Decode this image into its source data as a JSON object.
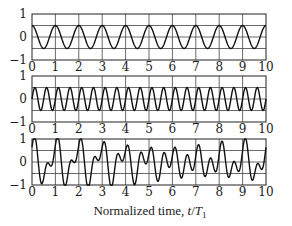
{
  "chart_data": [
    {
      "type": "line",
      "title": "",
      "xlabel": "",
      "ylabel": "",
      "xlim": [
        0,
        10
      ],
      "ylim": [
        -1,
        1
      ],
      "grid": true,
      "x_ticks": [
        "0",
        "1",
        "2",
        "3",
        "4",
        "5",
        "6",
        "7",
        "8",
        "9",
        "10"
      ],
      "y_ticks": [
        "1",
        "0",
        "−1"
      ],
      "y_gridlines": [
        -0.5,
        0,
        0.5
      ],
      "series": [
        {
          "name": "component 1",
          "function": "cos",
          "frequency": 1,
          "amplitude": 0.5,
          "phase": 0
        }
      ]
    },
    {
      "type": "line",
      "title": "",
      "xlabel": "",
      "ylabel": "",
      "xlim": [
        0,
        10
      ],
      "ylim": [
        -1,
        1
      ],
      "grid": true,
      "x_ticks": [
        "0",
        "1",
        "2",
        "3",
        "4",
        "5",
        "6",
        "7",
        "8",
        "9",
        "10"
      ],
      "y_ticks": [
        "1",
        "0",
        "−1"
      ],
      "y_gridlines": [
        -0.5,
        0,
        0.5
      ],
      "series": [
        {
          "name": "component 2",
          "function": "sin",
          "frequency": 2,
          "amplitude": 0.5,
          "phase": 0
        }
      ]
    },
    {
      "type": "line",
      "title": "",
      "xlabel": "Normalized time, t/T₁",
      "ylabel": "",
      "xlim": [
        0,
        10
      ],
      "ylim": [
        -1,
        1
      ],
      "grid": true,
      "x_ticks": [
        "0",
        "1",
        "2",
        "3",
        "4",
        "5",
        "6",
        "7",
        "8",
        "9",
        "10"
      ],
      "y_ticks": [
        "1",
        "0",
        "−1"
      ],
      "y_gridlines": [
        -0.5,
        0,
        0.5
      ],
      "series": [
        {
          "name": "combined signal",
          "components": [
            {
              "function": "cos",
              "frequency": 1,
              "amplitude": 0.5,
              "phase": 0
            },
            {
              "function": "sin",
              "frequency": 2,
              "amplitude": 0.5,
              "phase": 0
            },
            {
              "function": "sin",
              "frequency": 1.1,
              "amplitude": 0.25,
              "phase": 0.6
            }
          ]
        }
      ]
    }
  ],
  "labels": {
    "xlabel_main": "Normalized time, ",
    "xlabel_var": "t",
    "xlabel_slash": "/",
    "xlabel_T": "T",
    "xlabel_sub": "1"
  }
}
